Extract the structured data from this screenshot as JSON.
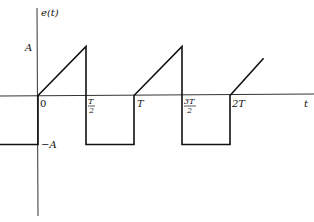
{
  "diagram": {
    "y_axis_label": "e(t)",
    "x_axis_label": "t",
    "y_ticks": [
      {
        "label": "A",
        "value": 1
      },
      {
        "label": "−A",
        "value": -1
      }
    ],
    "x_ticks": [
      {
        "label": "0",
        "value": 0
      },
      {
        "label_num": "T",
        "label_den": "2",
        "value": 0.5
      },
      {
        "label": "T",
        "value": 1
      },
      {
        "label_num": "3T",
        "label_den": "2",
        "value": 1.5
      },
      {
        "label": "2T",
        "value": 2
      }
    ],
    "waveform_points": [
      {
        "t": -0.6,
        "e": -1
      },
      {
        "t": 0,
        "e": -1
      },
      {
        "t": 0,
        "e": 0
      },
      {
        "t": 0.5,
        "e": 1
      },
      {
        "t": 0.5,
        "e": -1
      },
      {
        "t": 1,
        "e": -1
      },
      {
        "t": 1,
        "e": 0
      },
      {
        "t": 1.5,
        "e": 1
      },
      {
        "t": 1.5,
        "e": -1
      },
      {
        "t": 2,
        "e": -1
      },
      {
        "t": 2,
        "e": 0
      },
      {
        "t": 2.35,
        "e": 0.76
      }
    ]
  }
}
